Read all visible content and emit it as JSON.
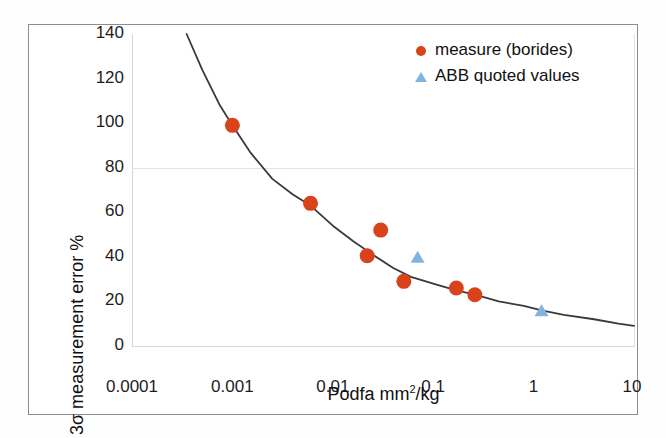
{
  "chart_data": {
    "type": "scatter",
    "title": "",
    "xlabel": "Podfa mm2/kg",
    "xlabel_parts": {
      "pre": "Podfa mm",
      "sup": "2",
      "post": "/kg"
    },
    "ylabel": "3σ measurement error %",
    "xscale": "log",
    "yscale": "linear",
    "xlim": [
      0.0001,
      10
    ],
    "ylim": [
      0,
      140
    ],
    "xticks": [
      "0.0001",
      "0.001",
      "0.01",
      "0.1",
      "1",
      "10"
    ],
    "xtick_values": [
      0.0001,
      0.001,
      0.01,
      0.1,
      1,
      10
    ],
    "yticks": [
      "0",
      "20",
      "40",
      "60",
      "80",
      "100",
      "120",
      "140"
    ],
    "ytick_values": [
      0,
      20,
      40,
      60,
      80,
      100,
      120,
      140
    ],
    "grid": "horizontal-at-80-only",
    "gridlines_y": [
      80
    ],
    "legend_position": "top-right",
    "series": [
      {
        "name": "measure (borides)",
        "marker": "circle",
        "color": "#d8431c",
        "points": [
          {
            "x": 0.001,
            "y": 99
          },
          {
            "x": 0.006,
            "y": 64
          },
          {
            "x": 0.022,
            "y": 40.5
          },
          {
            "x": 0.03,
            "y": 52
          },
          {
            "x": 0.051,
            "y": 29
          },
          {
            "x": 0.17,
            "y": 26
          },
          {
            "x": 0.26,
            "y": 23
          }
        ]
      },
      {
        "name": "ABB quoted values",
        "marker": "triangle",
        "color": "#82b4dd",
        "points": [
          {
            "x": 0.07,
            "y": 40
          },
          {
            "x": 1.2,
            "y": 16
          }
        ]
      },
      {
        "name": "fit curve",
        "marker": "line",
        "color": "#3a3a3a",
        "points": [
          {
            "x": 0.00035,
            "y": 140
          },
          {
            "x": 0.0005,
            "y": 124
          },
          {
            "x": 0.00075,
            "y": 108
          },
          {
            "x": 0.001,
            "y": 99
          },
          {
            "x": 0.0015,
            "y": 87
          },
          {
            "x": 0.0025,
            "y": 75
          },
          {
            "x": 0.004,
            "y": 68
          },
          {
            "x": 0.006,
            "y": 63
          },
          {
            "x": 0.01,
            "y": 54
          },
          {
            "x": 0.016,
            "y": 47
          },
          {
            "x": 0.025,
            "y": 41
          },
          {
            "x": 0.04,
            "y": 35
          },
          {
            "x": 0.06,
            "y": 31
          },
          {
            "x": 0.1,
            "y": 28
          },
          {
            "x": 0.17,
            "y": 25
          },
          {
            "x": 0.26,
            "y": 23
          },
          {
            "x": 0.45,
            "y": 20
          },
          {
            "x": 0.8,
            "y": 18
          },
          {
            "x": 1.2,
            "y": 16
          },
          {
            "x": 2.0,
            "y": 14
          },
          {
            "x": 4.0,
            "y": 12
          },
          {
            "x": 7.0,
            "y": 10
          },
          {
            "x": 10.0,
            "y": 9
          }
        ]
      }
    ]
  },
  "legend": {
    "items": [
      {
        "label": "measure (borides)",
        "marker": "circle",
        "color": "#d8431c"
      },
      {
        "label": "ABB quoted values",
        "marker": "triangle",
        "color": "#82b4dd"
      }
    ]
  },
  "colors": {
    "measure_red": "#d8431c",
    "abb_blue": "#82b4dd",
    "curve": "#3a3a3a",
    "grid": "#e3e3e3",
    "frame": "#8d8d8d"
  }
}
